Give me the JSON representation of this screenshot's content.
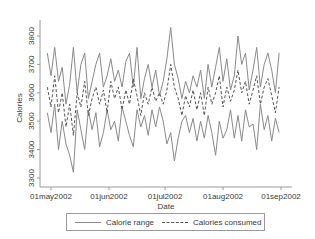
{
  "chart_data": {
    "type": "line",
    "title": "",
    "xlabel": "Date",
    "ylabel": "Calories",
    "x_tick_labels": [
      "01may2002",
      "01jun2002",
      "01jul2002",
      "01aug2002",
      "01sep2002"
    ],
    "y_tick_labels": [
      "3300",
      "3400",
      "3500",
      "3600",
      "3700",
      "3800"
    ],
    "ylim": [
      3280,
      3830
    ],
    "xlim_days_from_01may2002": [
      -3,
      126
    ],
    "grid": false,
    "legend_position": "bottom",
    "x_days_from_01may2002": [
      -2,
      0,
      2,
      4,
      6,
      8,
      10,
      12,
      14,
      16,
      18,
      20,
      22,
      24,
      26,
      28,
      30,
      32,
      34,
      36,
      38,
      40,
      42,
      44,
      46,
      48,
      50,
      52,
      54,
      56,
      58,
      60,
      62,
      64,
      66,
      68,
      70,
      72,
      74,
      76,
      78,
      80,
      82,
      84,
      86,
      88,
      90,
      92,
      94,
      96,
      98,
      100,
      102,
      104,
      106,
      108,
      110,
      112,
      114,
      116,
      118,
      120,
      122
    ],
    "series": [
      {
        "name": "Calorie range (upper)",
        "legend_group": "Calorie range",
        "style": "solid",
        "values": [
          3740,
          3660,
          3760,
          3640,
          3690,
          3560,
          3630,
          3760,
          3600,
          3700,
          3740,
          3580,
          3640,
          3700,
          3740,
          3620,
          3660,
          3720,
          3640,
          3680,
          3620,
          3710,
          3740,
          3620,
          3760,
          3580,
          3650,
          3700,
          3620,
          3680,
          3590,
          3640,
          3720,
          3830,
          3700,
          3650,
          3580,
          3640,
          3600,
          3660,
          3620,
          3680,
          3580,
          3700,
          3620,
          3690,
          3760,
          3640,
          3720,
          3610,
          3660,
          3800,
          3700,
          3740,
          3610,
          3680,
          3760,
          3620,
          3700,
          3740,
          3680,
          3600,
          3740
        ]
      },
      {
        "name": "Calorie range (lower)",
        "legend_group": "Calorie range",
        "style": "solid",
        "values": [
          3530,
          3460,
          3560,
          3400,
          3500,
          3420,
          3380,
          3320,
          3540,
          3470,
          3400,
          3540,
          3470,
          3530,
          3410,
          3460,
          3540,
          3470,
          3500,
          3430,
          3550,
          3500,
          3450,
          3410,
          3540,
          3480,
          3520,
          3450,
          3540,
          3480,
          3550,
          3500,
          3420,
          3460,
          3360,
          3440,
          3500,
          3520,
          3460,
          3510,
          3430,
          3500,
          3440,
          3520,
          3460,
          3380,
          3500,
          3440,
          3470,
          3540,
          3440,
          3520,
          3430,
          3540,
          3480,
          3490,
          3400,
          3560,
          3470,
          3520,
          3430,
          3510,
          3460
        ]
      },
      {
        "name": "Calories consumed",
        "legend_group": "Calories consumed",
        "style": "dashed",
        "values": [
          3620,
          3550,
          3660,
          3530,
          3600,
          3480,
          3560,
          3450,
          3600,
          3550,
          3640,
          3520,
          3580,
          3620,
          3560,
          3610,
          3530,
          3640,
          3580,
          3620,
          3540,
          3610,
          3560,
          3650,
          3590,
          3520,
          3600,
          3560,
          3620,
          3570,
          3600,
          3560,
          3610,
          3700,
          3620,
          3580,
          3520,
          3590,
          3550,
          3610,
          3540,
          3600,
          3520,
          3620,
          3560,
          3600,
          3660,
          3550,
          3620,
          3570,
          3610,
          3680,
          3600,
          3640,
          3560,
          3610,
          3660,
          3560,
          3620,
          3650,
          3590,
          3530,
          3620
        ]
      }
    ]
  },
  "axes": {
    "y_title": "Calories",
    "x_title": "Date"
  },
  "legend": {
    "items": [
      {
        "label": "Calorie range",
        "style": "solid"
      },
      {
        "label": "Calories consumed",
        "style": "dashed"
      }
    ]
  },
  "colors": {
    "range_line": "#8a8a8a",
    "consumed_line": "#555555",
    "axis": "#9a9a9a",
    "text": "#3a3a3a",
    "background": "#ffffff"
  }
}
